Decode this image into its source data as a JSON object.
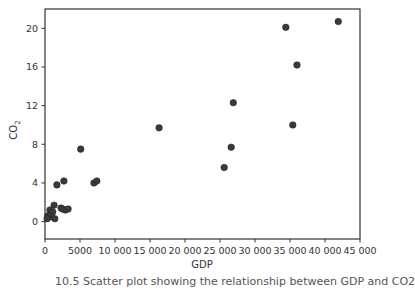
{
  "chart_data": {
    "type": "scatter",
    "title": "",
    "xlabel": "GDP",
    "ylabel": "CO2",
    "ylabel_display": "CO",
    "ylabel_subscript": "2",
    "xlim": [
      0,
      45000
    ],
    "ylim": [
      -1.8,
      22
    ],
    "xticks": [
      0,
      5000,
      10000,
      15000,
      20000,
      25000,
      30000,
      35000,
      40000,
      45000
    ],
    "xtick_labels": [
      "0",
      "5000",
      "10 000",
      "15 000",
      "20 000",
      "25 000",
      "30 000",
      "35 000",
      "40 000",
      "45 000"
    ],
    "yticks": [
      0,
      4,
      8,
      12,
      16,
      20
    ],
    "ytick_labels": [
      "0",
      "4",
      "8",
      "12",
      "16",
      "20"
    ],
    "grid": false,
    "legend": null,
    "marker_color": "#3a3a3a",
    "series": [
      {
        "name": "countries",
        "points": [
          {
            "x": 41900,
            "y": 20.7
          },
          {
            "x": 34400,
            "y": 20.1
          },
          {
            "x": 36000,
            "y": 16.2
          },
          {
            "x": 35400,
            "y": 10.0
          },
          {
            "x": 26900,
            "y": 12.3
          },
          {
            "x": 26600,
            "y": 7.7
          },
          {
            "x": 25600,
            "y": 5.6
          },
          {
            "x": 16300,
            "y": 9.7
          },
          {
            "x": 5100,
            "y": 7.5
          },
          {
            "x": 7000,
            "y": 4.0
          },
          {
            "x": 7400,
            "y": 4.2
          },
          {
            "x": 1700,
            "y": 3.8
          },
          {
            "x": 2700,
            "y": 4.2
          },
          {
            "x": 1300,
            "y": 1.7
          },
          {
            "x": 700,
            "y": 1.2
          },
          {
            "x": 2300,
            "y": 1.4
          },
          {
            "x": 2500,
            "y": 1.3
          },
          {
            "x": 2900,
            "y": 1.2
          },
          {
            "x": 3300,
            "y": 1.3
          },
          {
            "x": 1100,
            "y": 1.0
          },
          {
            "x": 900,
            "y": 0.5
          },
          {
            "x": 400,
            "y": 0.6
          },
          {
            "x": 1400,
            "y": 0.3
          },
          {
            "x": 300,
            "y": 0.3
          }
        ]
      }
    ]
  },
  "caption": "10.5 Scatter plot showing the relationship between GDP and CO2"
}
